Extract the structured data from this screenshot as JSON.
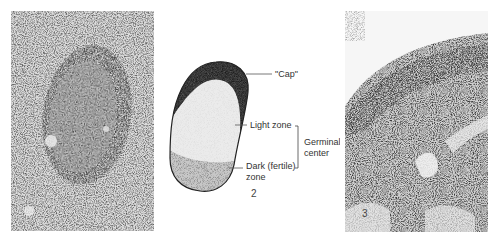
{
  "figure": {
    "panels": [
      {
        "id": "left",
        "kind": "micrograph",
        "description": "Lymphoid follicle with germinal center, low-magnification light micrograph"
      },
      {
        "id": "center",
        "kind": "schematic",
        "number_label": "2",
        "labels": {
          "cap": "\"Cap\"",
          "light_zone": "Light zone",
          "dark_zone_line1": "Dark (fertile)",
          "dark_zone_line2": "zone",
          "bracket_line1": "Germinal",
          "bracket_line2": "center"
        }
      },
      {
        "id": "right",
        "kind": "micrograph",
        "number_label": "3",
        "description": "Lymphoid tissue cortex with dense cellular region and lighter trabeculae"
      }
    ],
    "colors": {
      "cap": "#3a3a3a",
      "light_zone": "#ececec",
      "dark_zone": "#c4c4c4",
      "outline": "#222222",
      "leader": "#555555",
      "text": "#333333"
    }
  }
}
